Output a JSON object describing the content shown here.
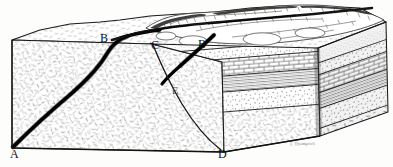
{
  "figure": {
    "kind": "geologic-block-diagram",
    "line_color": "#1a1a1a",
    "fault_color": "#000000",
    "paper_color": "#fdfdfc",
    "stipple_color": "#6f6f6f"
  },
  "labels": [
    {
      "id": "A",
      "text": "A",
      "x": 10,
      "y": 148,
      "faint": false
    },
    {
      "id": "B1",
      "text": "B",
      "x": 100,
      "y": 32,
      "faint": false
    },
    {
      "id": "C",
      "text": "C",
      "x": 151,
      "y": 39,
      "faint": false
    },
    {
      "id": "B2",
      "text": "B",
      "x": 198,
      "y": 38,
      "faint": false
    },
    {
      "id": "E",
      "text": "E",
      "x": 172,
      "y": 86,
      "faint": true
    },
    {
      "id": "D",
      "text": "D",
      "x": 218,
      "y": 148,
      "faint": false
    }
  ],
  "signature": {
    "text": "J. Thompson",
    "x": 290,
    "y": 141
  },
  "strata": [
    {
      "name": "soil-surface-layer",
      "pattern": "fine-stipple",
      "label": "surface regolith"
    },
    {
      "name": "upper-sandstone",
      "pattern": "dense-stipple",
      "label": "sandstone"
    },
    {
      "name": "limestone-brick-bed",
      "pattern": "brick",
      "label": "limestone"
    },
    {
      "name": "shale-laminated-bed",
      "pattern": "horizontal-lines",
      "label": "shale"
    },
    {
      "name": "lower-sandstone",
      "pattern": "coarse-stipple",
      "label": "sandstone"
    },
    {
      "name": "crystalline-basement",
      "pattern": "dash-hatch",
      "label": "crystalline basement rock"
    }
  ],
  "features": [
    {
      "name": "fault-trace-left",
      "from": "A",
      "to": "B",
      "type": "normal-fault"
    },
    {
      "name": "fault-trace-right",
      "from": "D",
      "to": "C",
      "type": "normal-fault"
    },
    {
      "name": "fault-scarp",
      "type": "eroded-scarp-ridge"
    },
    {
      "name": "downthrown-block",
      "type": "hanging-wall"
    },
    {
      "name": "upthrown-block",
      "type": "footwall"
    }
  ]
}
